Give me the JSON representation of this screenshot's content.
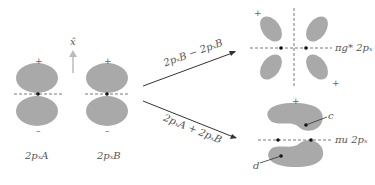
{
  "diagram": {
    "axis_label": "x̂",
    "orbital_A_label": "2pₓA",
    "orbital_B_label": "2pₓB",
    "arrow_top_label": "2pₓB − 2pₓB",
    "arrow_bottom_label": "2pₓA + 2pₓB",
    "antibonding_label": "πg* 2pₓ",
    "bonding_label": "πu 2pₓ",
    "point_c": "c",
    "point_d": "d",
    "plus": "+",
    "minus": "–",
    "colors": {
      "lobe": "#a9a9a9",
      "line": "#333333",
      "arrow_axis": "#bbbbbb"
    }
  }
}
